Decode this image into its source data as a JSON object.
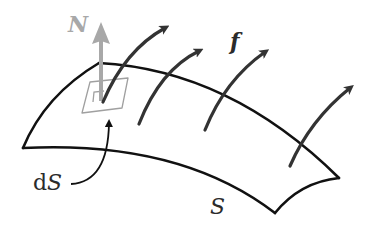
{
  "figure": {
    "labels": {
      "normal": "N",
      "field": "f",
      "area_element_prefix": "d",
      "area_element_symbol": "S",
      "surface": "S"
    },
    "colors": {
      "outline": "#111111",
      "field_arrows": "#333333",
      "normal_vector": "#a8a8a8",
      "area_patch": "#a0a0a0",
      "label_text": "#2b2b2b"
    },
    "field_arrow_count": 4
  }
}
